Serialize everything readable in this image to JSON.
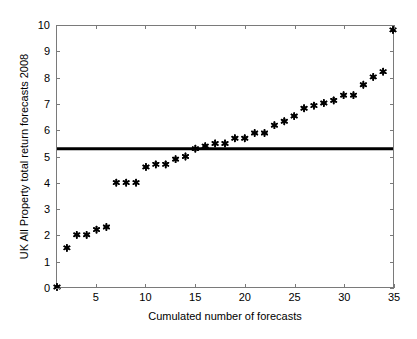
{
  "chart_data": {
    "type": "scatter",
    "title": "",
    "xlabel": "Cumulated number of forecasts",
    "ylabel": "UK All Property total return forecasts 2008",
    "xlim": [
      1,
      35
    ],
    "ylim": [
      0,
      10
    ],
    "xticks": [
      5,
      10,
      15,
      20,
      25,
      30,
      35
    ],
    "yticks": [
      0,
      1,
      2,
      3,
      4,
      5,
      6,
      7,
      8,
      9,
      10
    ],
    "grid": false,
    "legend": null,
    "marker": "asterisk",
    "marker_color": "#000000",
    "x": [
      1,
      2,
      3,
      4,
      5,
      6,
      7,
      8,
      9,
      10,
      11,
      12,
      13,
      14,
      15,
      16,
      17,
      18,
      19,
      20,
      21,
      22,
      23,
      24,
      25,
      26,
      27,
      28,
      29,
      30,
      31,
      32,
      33,
      34,
      35
    ],
    "values": [
      0.0,
      1.5,
      2.0,
      2.0,
      2.2,
      2.3,
      4.0,
      4.0,
      4.0,
      4.6,
      4.7,
      4.7,
      4.9,
      5.0,
      5.3,
      5.4,
      5.5,
      5.5,
      5.7,
      5.7,
      5.9,
      5.9,
      6.2,
      6.35,
      6.55,
      6.85,
      6.95,
      7.05,
      7.15,
      7.35,
      7.35,
      7.75,
      8.05,
      8.25,
      9.85
    ],
    "series": [
      {
        "name": "UK All Property total return forecasts 2008",
        "values": [
          0.0,
          1.5,
          2.0,
          2.0,
          2.2,
          2.3,
          4.0,
          4.0,
          4.0,
          4.6,
          4.7,
          4.7,
          4.9,
          5.0,
          5.3,
          5.4,
          5.5,
          5.5,
          5.7,
          5.7,
          5.9,
          5.9,
          6.2,
          6.35,
          6.55,
          6.85,
          6.95,
          7.05,
          7.15,
          7.35,
          7.35,
          7.75,
          8.05,
          8.25,
          9.85
        ]
      }
    ],
    "reference_line": {
      "name": "consensus-mean",
      "orientation": "horizontal",
      "y": 5.3,
      "color": "#000000",
      "linewidth": 3
    },
    "axis_color": "#7a7a7a",
    "background": "#ffffff"
  },
  "axis_titles": {
    "x": "Cumulated number of forecasts",
    "y": "UK All Property total return forecasts 2008"
  },
  "ticks": {
    "x": [
      "5",
      "10",
      "15",
      "20",
      "25",
      "30",
      "35"
    ],
    "y": [
      "0",
      "1",
      "2",
      "3",
      "4",
      "5",
      "6",
      "7",
      "8",
      "9",
      "10"
    ]
  }
}
